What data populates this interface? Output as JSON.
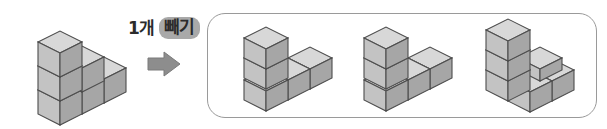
{
  "page": {
    "kind": "math-worksheet-figure",
    "width": 607,
    "height": 129,
    "background_color": "#ffffff"
  },
  "operation": {
    "count_label": "1개",
    "verb_label": "빼기",
    "full_text": "1개 빼기",
    "verb_highlight_color": "#a9a9a9",
    "text_color": "#2b2b2b",
    "arrow_icon": "arrow-right-icon",
    "arrow_color": "#8d8d8d"
  },
  "cube_style": {
    "top_face_color": "#d8d8d8",
    "left_face_color": "#c3c3c3",
    "right_face_color": "#a6a6a6",
    "edge_color": "#4d4d4d"
  },
  "source_figure": {
    "name": "original-cube-structure",
    "cube_count": 6,
    "description": "L-shaped arrangement of 6 unit cubes",
    "cubes": [
      {
        "x": 0,
        "y": 0,
        "z": 0
      },
      {
        "x": 1,
        "y": 0,
        "z": 0
      },
      {
        "x": 2,
        "y": 0,
        "z": 0
      },
      {
        "x": 0,
        "y": 1,
        "z": 0
      },
      {
        "x": 0,
        "y": 0,
        "z": 1
      },
      {
        "x": 0,
        "y": 0,
        "z": 2
      }
    ]
  },
  "answer_panel": {
    "name": "answer-choices-panel",
    "border_color": "#9a9a9a",
    "options": [
      {
        "name": "answer-option-1",
        "cube_count": 5,
        "description": "5 cubes: flat L with one cube stacked at back-left",
        "cubes": [
          {
            "x": 0,
            "y": 0,
            "z": 0
          },
          {
            "x": 1,
            "y": 0,
            "z": 0
          },
          {
            "x": 2,
            "y": 0,
            "z": 0
          },
          {
            "x": 0,
            "y": 1,
            "z": 0
          },
          {
            "x": 1,
            "y": 1,
            "z": 0
          },
          {
            "x": 0,
            "y": 0,
            "z": 1
          }
        ]
      },
      {
        "name": "answer-option-2",
        "cube_count": 5,
        "description": "5 cubes: Z/S shaped flat arrangement with one stacked cube",
        "cubes": [
          {
            "x": 0,
            "y": 0,
            "z": 0
          },
          {
            "x": 1,
            "y": 0,
            "z": 0
          },
          {
            "x": 1,
            "y": 1,
            "z": 0
          },
          {
            "x": 2,
            "y": 1,
            "z": 0
          },
          {
            "x": 0,
            "y": 0,
            "z": 1
          }
        ]
      },
      {
        "name": "answer-option-3",
        "cube_count": 5,
        "description": "5 cubes: two stacked at left plus step arrangement",
        "cubes": [
          {
            "x": 0,
            "y": 0,
            "z": 0
          },
          {
            "x": 1,
            "y": 0,
            "z": 0
          },
          {
            "x": 2,
            "y": 0,
            "z": 0
          },
          {
            "x": 1,
            "y": 1,
            "z": 0
          },
          {
            "x": 0,
            "y": 0,
            "z": 1
          },
          {
            "x": 0,
            "y": 0,
            "z": 2
          }
        ]
      }
    ]
  }
}
